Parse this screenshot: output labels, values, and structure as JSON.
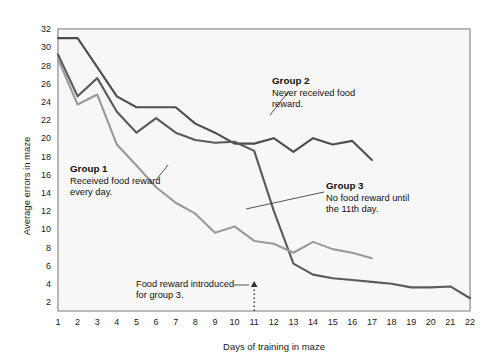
{
  "chart_data": {
    "type": "line",
    "title": "",
    "xlabel": "Days of training in maze",
    "ylabel": "Average errors in maze",
    "xlim": [
      1,
      22
    ],
    "ylim": [
      1,
      32
    ],
    "grid": true,
    "legend_position": "inline-annotations",
    "x": [
      1,
      2,
      3,
      4,
      5,
      6,
      7,
      8,
      9,
      10,
      11,
      12,
      13,
      14,
      15,
      16,
      17,
      18,
      19,
      20,
      21,
      22
    ],
    "yticks": [
      2,
      4,
      6,
      8,
      10,
      12,
      14,
      16,
      18,
      20,
      22,
      24,
      26,
      28,
      30,
      32
    ],
    "xticks": [
      1,
      2,
      3,
      4,
      5,
      6,
      7,
      8,
      9,
      10,
      11,
      12,
      13,
      14,
      15,
      16,
      17,
      18,
      19,
      20,
      21,
      22
    ],
    "series": [
      {
        "name": "Group 2",
        "color": "#4d4d4d",
        "x": [
          1,
          2,
          3,
          4,
          5,
          6,
          7,
          8,
          9,
          10,
          11,
          12,
          13,
          14,
          15,
          16,
          17
        ],
        "values": [
          31.0,
          31.0,
          27.8,
          24.6,
          23.4,
          23.4,
          23.4,
          21.6,
          20.6,
          19.4,
          19.4,
          20.0,
          18.5,
          20.0,
          19.3,
          19.7,
          17.6
        ]
      },
      {
        "name": "Group 3",
        "color": "#5a5a5a",
        "x": [
          1,
          2,
          3,
          4,
          5,
          6,
          7,
          8,
          9,
          10,
          11,
          12,
          13,
          14,
          15,
          16,
          17,
          18,
          19,
          20,
          21,
          22
        ],
        "values": [
          29.2,
          24.6,
          26.6,
          22.9,
          20.6,
          22.2,
          20.6,
          19.8,
          19.5,
          19.6,
          18.6,
          12.0,
          6.2,
          5.0,
          4.6,
          4.4,
          4.2,
          4.0,
          3.6,
          3.6,
          3.7,
          2.4
        ]
      },
      {
        "name": "Group 1",
        "color": "#9a9a9a",
        "x": [
          1,
          2,
          3,
          4,
          5,
          6,
          7,
          8,
          9,
          10,
          11,
          12,
          13,
          14,
          15,
          16,
          17
        ],
        "values": [
          28.7,
          23.7,
          24.8,
          19.3,
          17.0,
          14.6,
          12.9,
          11.7,
          9.6,
          10.3,
          8.7,
          8.4,
          7.4,
          8.6,
          7.8,
          7.4,
          6.8
        ]
      }
    ],
    "annotations": [
      {
        "id": "group-1",
        "heading": "Group 1",
        "body_lines": [
          "Received food reward",
          "every day."
        ],
        "x_px": 70,
        "y_px": 172,
        "leader": {
          "x1": 156,
          "y1": 180,
          "x2": 168,
          "y2": 165
        }
      },
      {
        "id": "group-2",
        "heading": "Group 2",
        "body_lines": [
          "Never received food",
          "reward."
        ],
        "x_px": 272,
        "y_px": 84,
        "leader": {
          "x1": 270,
          "y1": 115,
          "x2": 289,
          "y2": 91
        }
      },
      {
        "id": "group-3",
        "heading": "Group 3",
        "body_lines": [
          "No food reward until",
          "the 11th day."
        ],
        "x_px": 326,
        "y_px": 189,
        "leader": {
          "x1": 246,
          "y1": 209,
          "x2": 324,
          "y2": 192
        }
      },
      {
        "id": "food-reward-note",
        "heading": "",
        "body_lines": [
          "Food reward introduced",
          "for group 3."
        ],
        "x_px": 136,
        "y_px": 287,
        "leader": {
          "x1": 234,
          "y1": 285,
          "x2": 249,
          "y2": 285
        }
      }
    ],
    "marker_arrow": {
      "label": "food reward introduced at day 11",
      "x_day": 11,
      "y_top": 281,
      "y_bottom": 311
    }
  },
  "axes": {
    "y_label": "Average errors in maze",
    "x_label": "Days of training in maze"
  },
  "colors": {
    "group1": "#9a9a9a",
    "group2": "#4d4d4d",
    "group3": "#5a5a5a",
    "grid_minor": "#d8d8d8",
    "grid_major": "#b9b9b9",
    "plot_bg": "#f7f7f7",
    "frame": "#8a8a8a",
    "text": "#111111",
    "page_bg": "#ffffff"
  }
}
